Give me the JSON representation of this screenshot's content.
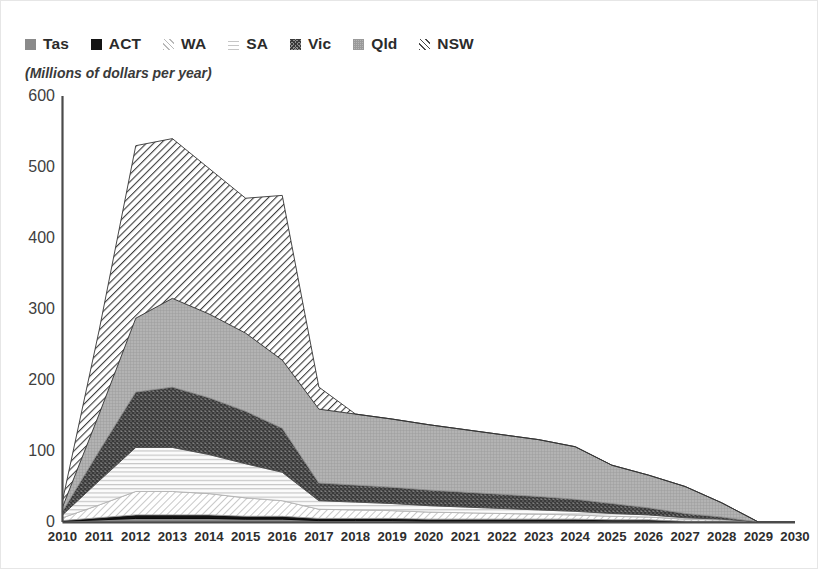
{
  "chart_data": {
    "type": "area",
    "title": "",
    "subtitle": "",
    "units_note": "(Millions of dollars per year)",
    "xlabel": "",
    "ylabel": "",
    "stacked": true,
    "grid": false,
    "legend_position": "top-left",
    "ylim": [
      0,
      600
    ],
    "yticks": [
      0,
      100,
      200,
      300,
      400,
      500,
      600
    ],
    "ytick_labels": [
      "0",
      "100",
      "200",
      "300",
      "400",
      "500",
      "600"
    ],
    "x": [
      2010,
      2011,
      2012,
      2013,
      2014,
      2015,
      2016,
      2017,
      2018,
      2019,
      2020,
      2021,
      2022,
      2023,
      2024,
      2025,
      2026,
      2027,
      2028,
      2029,
      2030
    ],
    "xtick_labels": [
      "2010",
      "2011",
      "2012",
      "2013",
      "2014",
      "2015",
      "2016",
      "2017",
      "2018",
      "2019",
      "2020",
      "2021",
      "2022",
      "2023",
      "2024",
      "2025",
      "2026",
      "2027",
      "2028",
      "2029",
      "2030"
    ],
    "stack_order_bottom_to_top": [
      "Tas",
      "ACT",
      "WA",
      "SA",
      "Vic",
      "Qld",
      "NSW"
    ],
    "series": [
      {
        "name": "Tas",
        "pattern": "solid-gray",
        "color": "#8a8a8a",
        "values": [
          1,
          3,
          5,
          5,
          5,
          4,
          4,
          2,
          2,
          2,
          1,
          1,
          1,
          1,
          1,
          1,
          1,
          0,
          0,
          0,
          0
        ]
      },
      {
        "name": "ACT",
        "pattern": "solid-black",
        "color": "#141414",
        "values": [
          1,
          3,
          5,
          5,
          5,
          4,
          4,
          3,
          3,
          3,
          3,
          3,
          3,
          3,
          3,
          2,
          2,
          1,
          1,
          0,
          0
        ]
      },
      {
        "name": "WA",
        "pattern": "diagonal-light",
        "color": "#d0d0d0",
        "values": [
          4,
          18,
          33,
          33,
          30,
          26,
          22,
          13,
          12,
          11,
          10,
          9,
          8,
          7,
          6,
          5,
          4,
          3,
          2,
          0,
          0
        ]
      },
      {
        "name": "SA",
        "pattern": "horizontal-lines",
        "color": "#e8e8e8",
        "values": [
          4,
          34,
          62,
          62,
          55,
          48,
          40,
          12,
          11,
          10,
          9,
          8,
          7,
          6,
          5,
          4,
          3,
          2,
          1,
          0,
          0
        ]
      },
      {
        "name": "Vic",
        "pattern": "crosshatch-dark",
        "color": "#565656",
        "values": [
          5,
          42,
          78,
          85,
          80,
          74,
          62,
          25,
          24,
          23,
          22,
          21,
          20,
          19,
          17,
          14,
          10,
          6,
          3,
          0,
          0
        ]
      },
      {
        "name": "Qld",
        "pattern": "solid-midgray",
        "color": "#9e9e9e",
        "values": [
          6,
          52,
          104,
          125,
          118,
          110,
          96,
          104,
          100,
          96,
          92,
          88,
          84,
          80,
          74,
          54,
          46,
          38,
          20,
          0,
          0
        ]
      },
      {
        "name": "NSW",
        "pattern": "diagonal-bold",
        "color": "#2a2a2a",
        "values": [
          9,
          118,
          243,
          225,
          205,
          190,
          232,
          31,
          0,
          0,
          0,
          0,
          0,
          0,
          0,
          0,
          0,
          0,
          0,
          0,
          0
        ]
      }
    ],
    "totals": [
      30,
      270,
      530,
      540,
      498,
      456,
      460,
      190,
      152,
      145,
      137,
      130,
      123,
      116,
      106,
      80,
      66,
      50,
      27,
      0,
      0
    ],
    "annotations": []
  },
  "legend": {
    "items": [
      {
        "label": "Tas",
        "swatch": "swatch-tas-icon"
      },
      {
        "label": "ACT",
        "swatch": "swatch-act-icon"
      },
      {
        "label": "WA",
        "swatch": "swatch-wa-icon"
      },
      {
        "label": "SA",
        "swatch": "swatch-sa-icon"
      },
      {
        "label": "Vic",
        "swatch": "swatch-vic-icon"
      },
      {
        "label": "Qld",
        "swatch": "swatch-qld-icon"
      },
      {
        "label": "NSW",
        "swatch": "swatch-nsw-icon"
      }
    ]
  },
  "colors": {
    "axis": "#3c3c3c",
    "text": "#2e2e2e",
    "frame": "#e6e6e6",
    "background": "#ffffff"
  }
}
